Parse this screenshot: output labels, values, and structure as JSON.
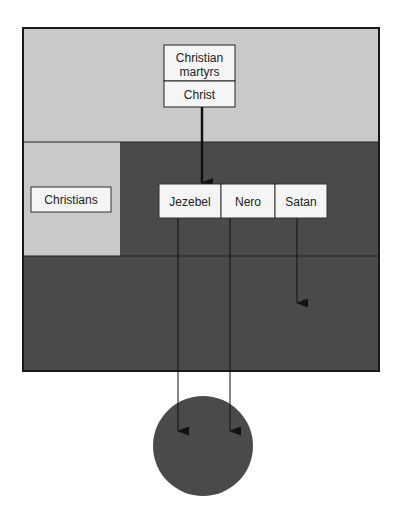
{
  "diagram": {
    "colors": {
      "light_region": "#c9c9c9",
      "dark_region": "#4a4a4a",
      "box_fill": "#f5f5f5",
      "stroke": "#1a1a1a",
      "circle": "#4a4a4a"
    },
    "top_box": {
      "upper_label_line1": "Christian",
      "upper_label_line2": "martyrs",
      "lower_label": "Christ"
    },
    "left_box": {
      "label": "Christians"
    },
    "row_boxes": [
      {
        "label": "Jezebel"
      },
      {
        "label": "Nero"
      },
      {
        "label": "Satan"
      }
    ],
    "arrows": [
      {
        "from": "Christ",
        "to": "Jezebel"
      },
      {
        "from": "Jezebel",
        "to": "circle"
      },
      {
        "from": "Nero",
        "to": "circle"
      },
      {
        "from": "Satan",
        "to": "dark-bottom-region"
      }
    ]
  }
}
